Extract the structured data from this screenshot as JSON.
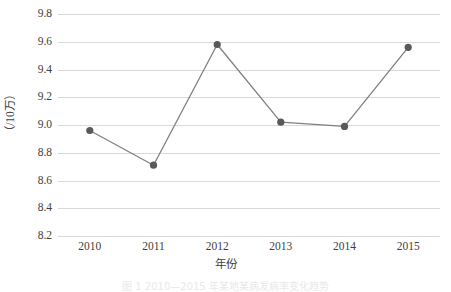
{
  "chart_data": {
    "type": "line",
    "title": "",
    "xlabel": "年份",
    "ylabel": "（/10万）",
    "categories": [
      "2010",
      "2011",
      "2012",
      "2013",
      "2014",
      "2015"
    ],
    "values": [
      8.96,
      8.71,
      9.58,
      9.02,
      8.99,
      9.56
    ],
    "series": [
      {
        "name": "发病率",
        "values": [
          8.96,
          8.71,
          9.58,
          9.02,
          8.99,
          9.56
        ]
      }
    ],
    "ylim": [
      8.2,
      9.8
    ],
    "ytick_step": 0.2,
    "yticks": [
      "9.8",
      "9.6",
      "9.4",
      "9.2",
      "9.0",
      "8.8",
      "8.6",
      "8.4",
      "8.2"
    ],
    "ytick_values": [
      9.8,
      9.6,
      9.4,
      9.2,
      9.0,
      8.8,
      8.6,
      8.4,
      8.2
    ],
    "grid": true,
    "grid_axis": "y",
    "legend": "none",
    "marker": "circle",
    "colors": {
      "line": "#808080",
      "marker": "#595959",
      "gridline": "#d9d9d9",
      "tick_label": "#404040",
      "background": "#ffffff"
    }
  },
  "caption": {
    "text": "图 1  2010—2015 年某地某病发病率变化趋势"
  }
}
